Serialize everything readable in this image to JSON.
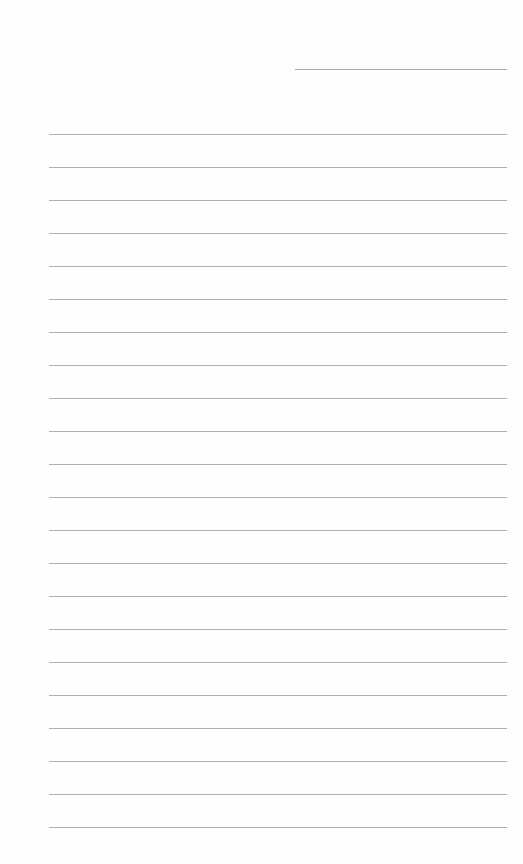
{
  "page": {
    "type": "lined-paper",
    "background_color": "#fefefe",
    "line_color": "#b0b0b0",
    "header_line": {
      "x1": 295,
      "x2": 507,
      "y": 69
    },
    "ruled_lines": {
      "x1": 49,
      "x2": 507,
      "first_y": 134,
      "spacing": 33,
      "count": 22
    }
  }
}
